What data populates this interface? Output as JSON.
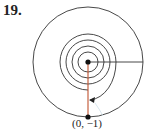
{
  "problem": {
    "number": "19."
  },
  "diagram": {
    "point_label": "(0, −1)",
    "colors": {
      "stroke": "#333333",
      "radius_line": "#c0522e",
      "dot": "#111111"
    }
  }
}
